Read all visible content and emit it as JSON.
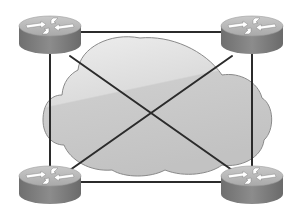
{
  "diagram": {
    "type": "network-topology",
    "topology": "full-mesh",
    "center": {
      "name": "cloud",
      "label": ""
    },
    "nodes": [
      {
        "id": "router-top-left",
        "kind": "router",
        "cx": 50,
        "cy": 32
      },
      {
        "id": "router-top-right",
        "kind": "router",
        "cx": 252,
        "cy": 32
      },
      {
        "id": "router-bottom-left",
        "kind": "router",
        "cx": 50,
        "cy": 182
      },
      {
        "id": "router-bottom-right",
        "kind": "router",
        "cx": 252,
        "cy": 182
      }
    ],
    "links": [
      {
        "from": "router-top-left",
        "to": "router-top-right"
      },
      {
        "from": "router-bottom-left",
        "to": "router-bottom-right"
      },
      {
        "from": "router-top-left",
        "to": "router-bottom-left"
      },
      {
        "from": "router-top-right",
        "to": "router-bottom-right"
      },
      {
        "from": "router-top-left",
        "to": "router-bottom-right"
      },
      {
        "from": "router-top-right",
        "to": "router-bottom-left"
      }
    ],
    "colors": {
      "link": "#2b2b2b",
      "cloud_fill_light": "#e6e6e6",
      "cloud_fill_dark": "#c4c4c4",
      "cloud_stroke": "#8a8a8a",
      "router_top": "#b9b9b9",
      "router_side": "#7f7f7f",
      "router_arrows": "#ffffff"
    }
  }
}
